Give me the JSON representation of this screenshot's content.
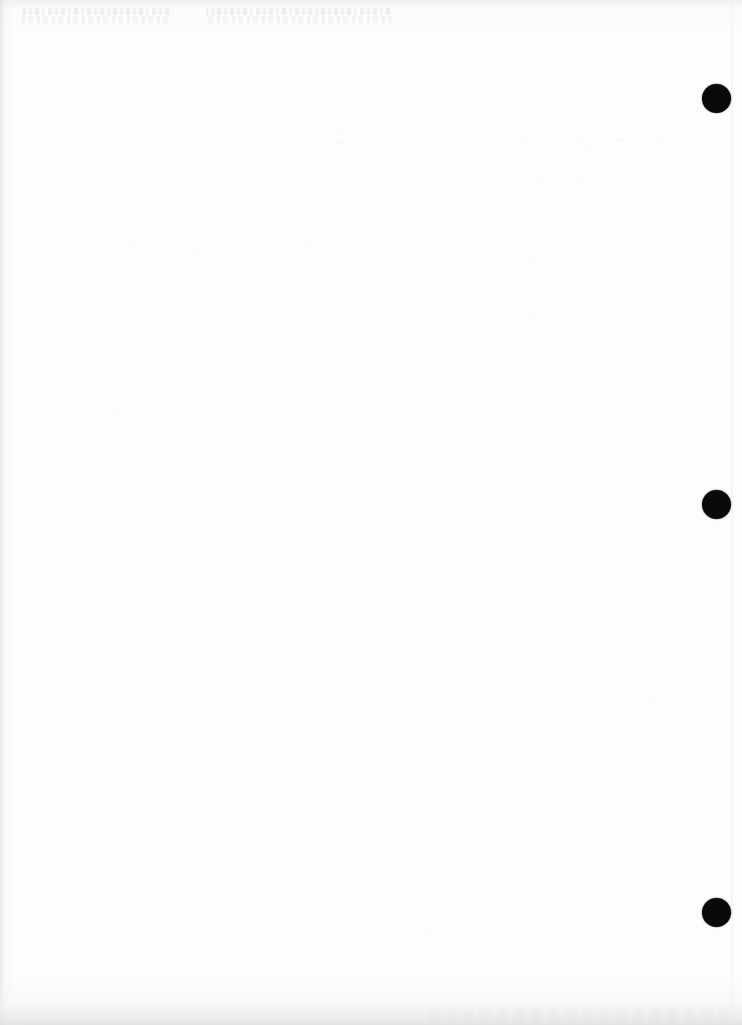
{
  "page": {
    "width_px": 742,
    "height_px": 1025,
    "background_color": "#fdfdfd",
    "paper_color": "#ffffff"
  },
  "marks": {
    "label": "Registration dots",
    "color": "#0a0a0a",
    "diameter_px": 29,
    "items": [
      {
        "name": "registration-dot-top",
        "cx": 716,
        "cy": 98,
        "d": 29
      },
      {
        "name": "registration-dot-middle",
        "cx": 716,
        "cy": 504,
        "d": 29
      },
      {
        "name": "registration-dot-bottom",
        "cx": 716,
        "cy": 912,
        "d": 29
      }
    ]
  },
  "artifacts": {
    "ghost_text": {
      "name": "bleed-through-text",
      "description": "Illegible faint show-through text from reverse side",
      "x": 22,
      "y": 8,
      "width": 370,
      "height": 17,
      "color": "#ebebed"
    },
    "page_edge_line": {
      "x": 731,
      "color": "#eeeef0"
    },
    "left_edge_shadow": {
      "width": 30,
      "color": "#d7d7d9"
    },
    "top_edge_shadow": {
      "height": 34,
      "color": "#e2e2e4"
    },
    "bottom_edge_shadow": {
      "height": 46,
      "color": "#e2e2e4"
    }
  },
  "specks": [
    {
      "x": 337,
      "y": 141,
      "s": 3
    },
    {
      "x": 520,
      "y": 142,
      "s": 2
    },
    {
      "x": 580,
      "y": 141,
      "s": 2
    },
    {
      "x": 585,
      "y": 146,
      "s": 2
    },
    {
      "x": 620,
      "y": 139,
      "s": 3
    },
    {
      "x": 630,
      "y": 143,
      "s": 2
    },
    {
      "x": 660,
      "y": 140,
      "s": 2
    },
    {
      "x": 540,
      "y": 177,
      "s": 2
    },
    {
      "x": 578,
      "y": 178,
      "s": 2
    },
    {
      "x": 543,
      "y": 196,
      "s": 2
    },
    {
      "x": 114,
      "y": 412,
      "s": 2
    },
    {
      "x": 305,
      "y": 243,
      "s": 2
    },
    {
      "x": 530,
      "y": 256,
      "s": 2
    },
    {
      "x": 196,
      "y": 251,
      "s": 2
    }
  ]
}
